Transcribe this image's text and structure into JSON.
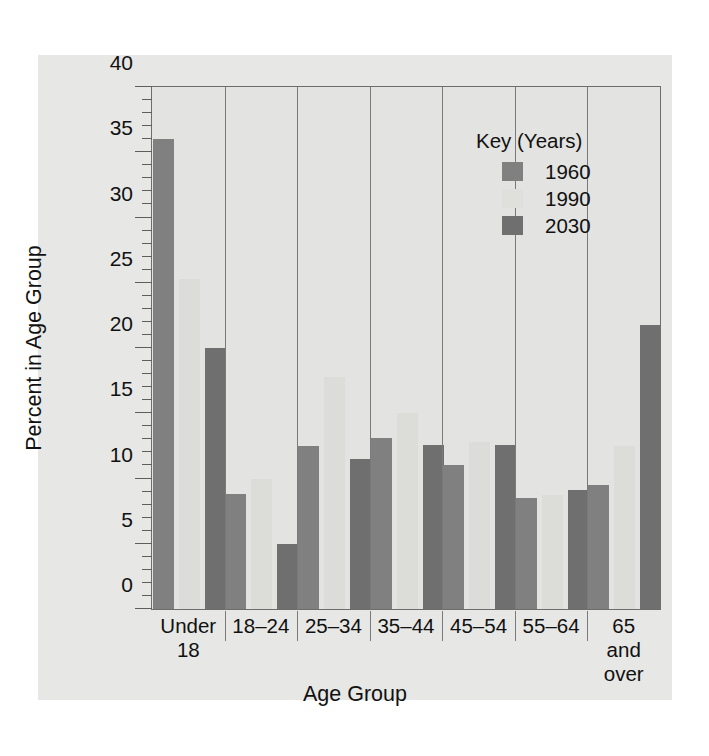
{
  "chart_data": {
    "type": "bar",
    "title": "",
    "xlabel": "Age Group",
    "ylabel": "Percent in Age Group",
    "ylim": [
      0,
      40
    ],
    "ytick_major_step": 5,
    "ytick_minor_step": 1,
    "ytick_labels": [
      "0",
      "5",
      "10",
      "15",
      "20",
      "25",
      "30",
      "35",
      "40"
    ],
    "grid": false,
    "legend_position": "inside-top-right",
    "legend_title": "Key (Years)",
    "categories": [
      "Under\n18",
      "18–24",
      "25–34",
      "35–44",
      "45–54",
      "55–64",
      "65\nand\nover"
    ],
    "series": [
      {
        "name": "1960",
        "color": "#808080",
        "values": [
          36.0,
          8.8,
          12.5,
          13.1,
          11.0,
          8.5,
          9.5
        ]
      },
      {
        "name": "1990",
        "color": "#dcdcd9",
        "values": [
          25.3,
          10.0,
          17.8,
          15.0,
          12.8,
          8.7,
          12.5
        ]
      },
      {
        "name": "2030",
        "color": "#6f6f6f",
        "values": [
          20.0,
          5.0,
          11.5,
          12.6,
          12.6,
          9.1,
          21.8
        ]
      }
    ]
  },
  "figure": {
    "plate_color": "#e7e7e5",
    "plot_bg_color": "#e3e3e1",
    "axis_color": "#6d6d6d"
  }
}
